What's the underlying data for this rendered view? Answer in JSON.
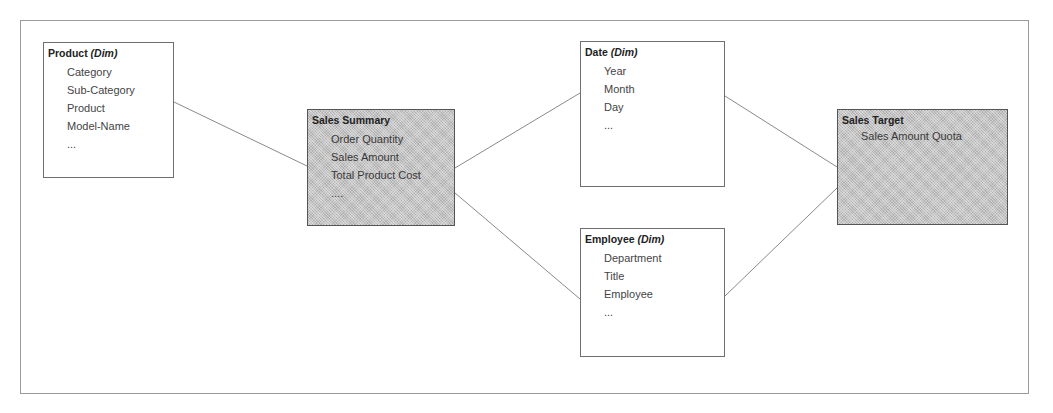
{
  "diagram": {
    "type": "star-schema",
    "colors": {
      "dimension_fill": "#ffffff",
      "fact_fill": "#c4c4c4",
      "border": "#6f6f6f",
      "line": "#8a8a8a"
    },
    "entities": {
      "product": {
        "name": "Product",
        "tag": "(Dim)",
        "kind": "dimension",
        "attributes": [
          "Category",
          "Sub-Category",
          "Product",
          "Model-Name",
          "..."
        ]
      },
      "sales_summary": {
        "name": "Sales Summary",
        "tag": "",
        "kind": "fact",
        "attributes": [
          "Order Quantity",
          "Sales Amount",
          "Total Product Cost",
          "...."
        ]
      },
      "date": {
        "name": "Date",
        "tag": "(Dim)",
        "kind": "dimension",
        "attributes": [
          "Year",
          "Month",
          "Day",
          "..."
        ]
      },
      "employee": {
        "name": "Employee",
        "tag": "(Dim)",
        "kind": "dimension",
        "attributes": [
          "Department",
          "Title",
          "Employee",
          "..."
        ]
      },
      "sales_target": {
        "name": "Sales Target",
        "tag": "",
        "kind": "fact",
        "attributes": [
          "Sales Amount Quota"
        ]
      }
    },
    "relationships": [
      {
        "from": "Product",
        "to": "Sales Summary"
      },
      {
        "from": "Sales Summary",
        "to": "Date"
      },
      {
        "from": "Sales Summary",
        "to": "Employee"
      },
      {
        "from": "Date",
        "to": "Sales Target"
      },
      {
        "from": "Employee",
        "to": "Sales Target"
      }
    ]
  }
}
